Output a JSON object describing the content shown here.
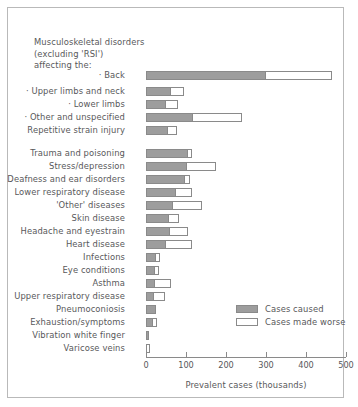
{
  "chart_data": {
    "type": "bar",
    "orientation": "horizontal",
    "stacked": true,
    "title": "",
    "xlabel": "Prevalent cases (thousands)",
    "ylabel": "",
    "xlim": [
      0,
      500
    ],
    "xticks": [
      0,
      100,
      200,
      300,
      400,
      500
    ],
    "xticklabels": [
      "0",
      "100",
      "200",
      "300",
      "400",
      "500"
    ],
    "grid": false,
    "legend_position": "center-right",
    "series": [
      {
        "name": "Cases caused",
        "color": "#9d9d9d",
        "values": [
          300,
          62,
          50,
          118,
          55,
          105,
          102,
          98,
          75,
          68,
          58,
          60,
          50,
          25,
          23,
          23,
          20,
          25,
          18,
          5,
          0
        ]
      },
      {
        "name": "Cases made worse",
        "color": "#ffffff",
        "values": [
          168,
          36,
          33,
          125,
          25,
          13,
          76,
          14,
          43,
          75,
          27,
          48,
          68,
          13,
          12,
          42,
          30,
          0,
          12,
          0,
          8
        ]
      }
    ],
    "categories": [
      "Back",
      "Upper limbs and neck",
      "Lower limbs",
      "Other and unspecified",
      "Repetitive strain injury",
      "Trauma and poisoning",
      "Stress/depression",
      "Deafness and ear disorders",
      "Lower respiratory disease",
      "'Other' diseases",
      "Skin disease",
      "Headache and eyestrain",
      "Heart disease",
      "Infections",
      "Eye conditions",
      "Asthma",
      "Upper respiratory disease",
      "Pneumoconiosis",
      "Exhaustion/symptoms",
      "Vibration white finger",
      "Varicose veins"
    ],
    "totals": [
      468,
      98,
      83,
      243,
      80,
      118,
      178,
      112,
      118,
      143,
      85,
      108,
      118,
      38,
      35,
      65,
      50,
      25,
      30,
      5,
      8
    ]
  },
  "header": {
    "line1": "Musculoskeletal disorders",
    "line2": "(excluding 'RSI')",
    "line3": "affecting the:"
  },
  "rows": [
    {
      "label": "· Back",
      "caused": 300,
      "worse": 168
    },
    {
      "label": "· Upper limbs and neck",
      "caused": 62,
      "worse": 36
    },
    {
      "label": "· Lower limbs",
      "caused": 50,
      "worse": 33
    },
    {
      "label": "· Other and unspecified",
      "caused": 118,
      "worse": 125
    },
    {
      "label": "Repetitive strain injury",
      "caused": 55,
      "worse": 25
    },
    {
      "label": "Trauma and poisoning",
      "caused": 105,
      "worse": 13
    },
    {
      "label": "Stress/depression",
      "caused": 102,
      "worse": 76
    },
    {
      "label": "Deafness and ear disorders",
      "caused": 98,
      "worse": 14
    },
    {
      "label": "Lower respiratory disease",
      "caused": 75,
      "worse": 43
    },
    {
      "label": "'Other' diseases",
      "caused": 68,
      "worse": 75
    },
    {
      "label": "Skin disease",
      "caused": 58,
      "worse": 27
    },
    {
      "label": "Headache and eyestrain",
      "caused": 60,
      "worse": 48
    },
    {
      "label": "Heart disease",
      "caused": 50,
      "worse": 68
    },
    {
      "label": "Infections",
      "caused": 25,
      "worse": 13
    },
    {
      "label": "Eye conditions",
      "caused": 23,
      "worse": 12
    },
    {
      "label": "Asthma",
      "caused": 23,
      "worse": 42
    },
    {
      "label": "Upper respiratory disease",
      "caused": 20,
      "worse": 30
    },
    {
      "label": "Pneumoconiosis",
      "caused": 25,
      "worse": 0
    },
    {
      "label": "Exhaustion/symptoms",
      "caused": 18,
      "worse": 12
    },
    {
      "label": "Vibration white finger",
      "caused": 5,
      "worse": 0
    },
    {
      "label": "Varicose veins",
      "caused": 0,
      "worse": 8
    }
  ],
  "axis": {
    "ticks": [
      "0",
      "100",
      "200",
      "300",
      "400",
      "500"
    ],
    "title": "Prevalent cases (thousands)"
  },
  "legend": {
    "caused_label": "Cases caused",
    "worse_label": "Cases made worse"
  },
  "colors": {
    "caused_fill": "#9d9d9d",
    "worse_fill": "#ffffff",
    "bar_stroke": "#8a8a8a",
    "text": "#58585a",
    "frame": "#b9b9b9"
  }
}
